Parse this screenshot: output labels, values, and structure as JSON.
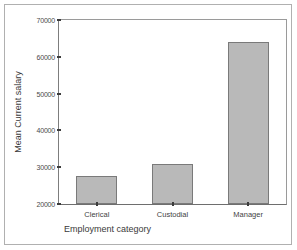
{
  "chart_data": {
    "type": "bar",
    "title": "",
    "subtitle": "",
    "xlabel": "Employment category",
    "ylabel": "Mean Current salary",
    "categories": [
      "Clerical",
      "Custodial",
      "Manager"
    ],
    "values": [
      27500,
      31000,
      64000
    ],
    "ylim": [
      20000,
      70000
    ],
    "yticks": [
      20000,
      30000,
      40000,
      50000,
      60000,
      70000
    ],
    "ytick_labels": [
      "20000",
      "30000",
      "40000",
      "50000",
      "60000",
      "70000"
    ],
    "grid": false,
    "legend": "none",
    "bar_fill_color": "#b9b9b9",
    "bar_edge_color": "#7a7a7a",
    "axis_color": "#7d7d7d",
    "background_color": "#ffffff"
  }
}
